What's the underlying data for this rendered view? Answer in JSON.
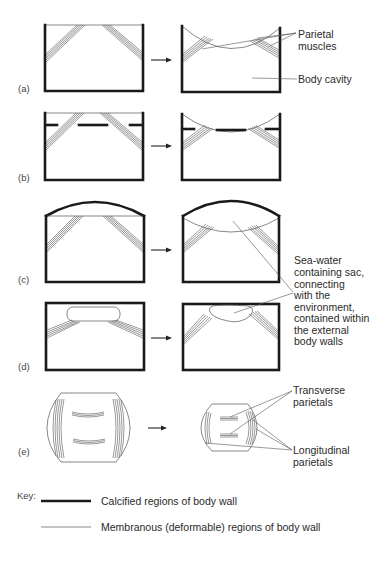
{
  "panels": [
    {
      "id": "a",
      "label": "(a)"
    },
    {
      "id": "b",
      "label": "(b)"
    },
    {
      "id": "c",
      "label": "(c)"
    },
    {
      "id": "d",
      "label": "(d)"
    },
    {
      "id": "e",
      "label": "(e)"
    }
  ],
  "annotations": {
    "parietal_muscles": [
      "Parietal",
      "muscles"
    ],
    "body_cavity": "Body cavity",
    "sea_water_sac": [
      "Sea-water",
      "containing sac,",
      "connecting",
      "with the",
      "environment,",
      "contained within",
      "the external",
      "body walls"
    ],
    "transverse_parietals": [
      "Transverse",
      "parietals"
    ],
    "longitudinal_parietals": [
      "Longitudinal",
      "parietals"
    ]
  },
  "key": {
    "title": "Key:",
    "items": [
      {
        "style": "thick",
        "label": "Calcified regions of body wall"
      },
      {
        "style": "thin",
        "label": "Membranous (deformable) regions of body wall"
      }
    ]
  },
  "colors": {
    "line": "#1a1a1a",
    "thin_line": "#555555",
    "text": "#2a2a2a",
    "background": "#ffffff"
  }
}
